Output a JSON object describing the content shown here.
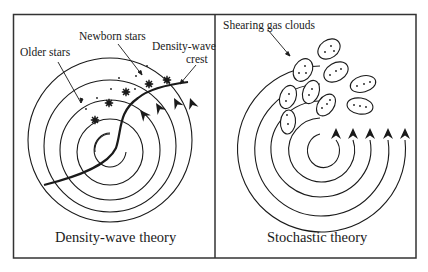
{
  "figure": {
    "panels": [
      {
        "id": "density-wave",
        "caption": "Density-wave theory",
        "labels": {
          "older_stars": "Older stars",
          "newborn_stars": "Newborn stars",
          "crest_line1": "Density-wave",
          "crest_line2": "crest"
        }
      },
      {
        "id": "stochastic",
        "caption": "Stochastic theory",
        "labels": {
          "gas_clouds": "Shearing gas clouds"
        }
      }
    ],
    "colors": {
      "ink": "#1a1a1a",
      "background": "#ffffff",
      "border": "#333333"
    }
  }
}
